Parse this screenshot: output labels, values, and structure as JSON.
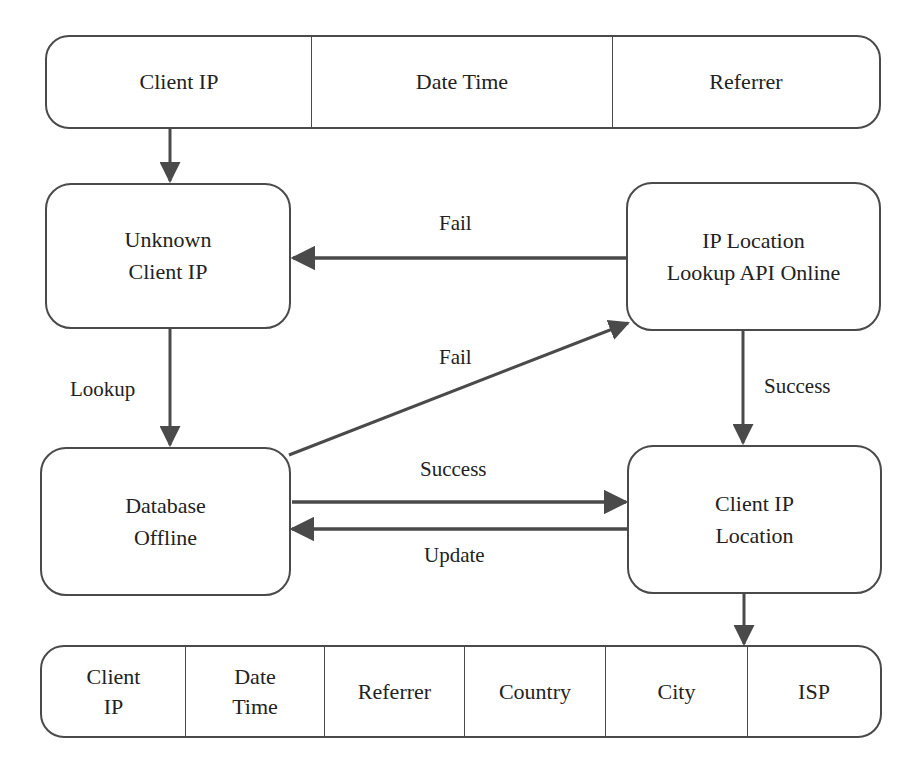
{
  "diagram": {
    "input_record": {
      "fields": [
        "Client IP",
        "Date Time",
        "Referrer"
      ]
    },
    "nodes": {
      "unknown_client_ip": {
        "line1": "Unknown",
        "line2": "Client IP"
      },
      "ip_location_api": {
        "line1": "IP Location",
        "line2": "Lookup API Online"
      },
      "database_offline": {
        "line1": "Database",
        "line2": "Offline"
      },
      "client_ip_location": {
        "line1": "Client IP",
        "line2": "Location"
      }
    },
    "edges": {
      "api_to_unknown": "Fail",
      "unknown_to_db": "Lookup",
      "db_to_api": "Fail",
      "api_to_location": "Success",
      "db_to_location": "Success",
      "location_to_db": "Update"
    },
    "output_record": {
      "fields": [
        {
          "line1": "Client",
          "line2": "IP"
        },
        {
          "line1": "Date",
          "line2": "Time"
        },
        {
          "line1": "Referrer",
          "line2": ""
        },
        {
          "line1": "Country",
          "line2": ""
        },
        {
          "line1": "City",
          "line2": ""
        },
        {
          "line1": "ISP",
          "line2": ""
        }
      ]
    },
    "colors": {
      "stroke": "#4a4a4a",
      "background": "#ffffff",
      "text": "#222222"
    }
  }
}
